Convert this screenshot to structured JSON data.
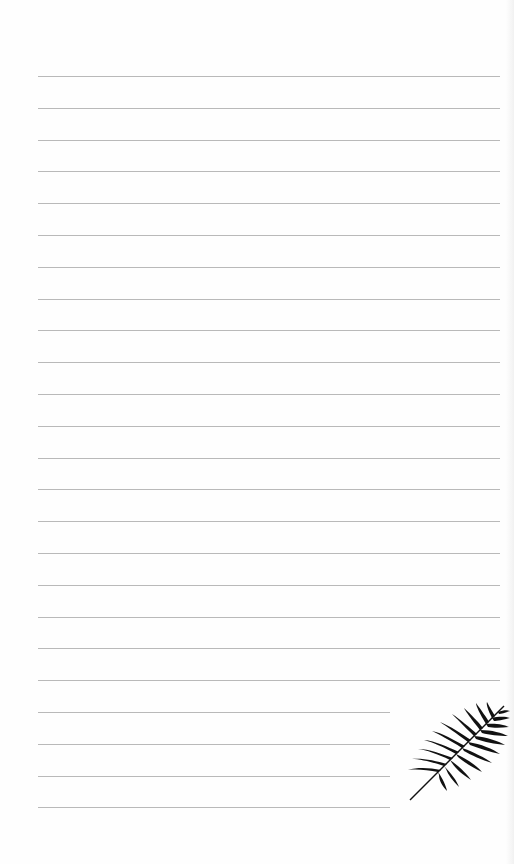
{
  "page": {
    "type": "lined-notepaper",
    "background_color": "#fefefe",
    "line_color": "#b9b9b9",
    "line_count": 24,
    "full_width_lines": 20,
    "short_lines": 4,
    "first_line_y": 76,
    "line_spacing": 31.8
  },
  "decoration": {
    "icon": "palm-leaf-icon",
    "color": "#111111",
    "position": "bottom-right"
  }
}
